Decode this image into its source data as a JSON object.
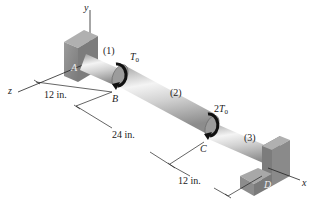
{
  "diagram": {
    "type": "compound torsion shaft",
    "axes": {
      "x": "x",
      "y": "y",
      "z": "z"
    },
    "supports": [
      {
        "id": "A",
        "label": "A",
        "kind": "fixed wall"
      },
      {
        "id": "D",
        "label": "D",
        "kind": "fixed wall"
      }
    ],
    "points": [
      {
        "id": "B",
        "label": "B"
      },
      {
        "id": "C",
        "label": "C"
      }
    ],
    "segments": [
      {
        "label": "(1)",
        "from": "A",
        "to": "B",
        "length": "12 in."
      },
      {
        "label": "(2)",
        "from": "B",
        "to": "C",
        "length": "24 in."
      },
      {
        "label": "(3)",
        "from": "C",
        "to": "D",
        "length": "12 in."
      }
    ],
    "torques": [
      {
        "at": "B",
        "coef": "",
        "symbol": "T",
        "sub": "0"
      },
      {
        "at": "C",
        "coef": "2",
        "symbol": "T",
        "sub": "0"
      }
    ],
    "colors": {
      "support": "#8a8a8a",
      "support_dark": "#6b6b6b",
      "shaft_light": "#f2f2f2",
      "shaft_mid": "#c9c9c9",
      "shaft_dark": "#8f8f8f",
      "line": "#222222"
    }
  }
}
